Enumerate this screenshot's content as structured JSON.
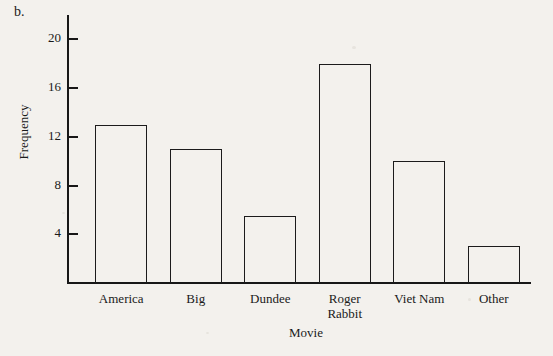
{
  "figure": {
    "part_label": "b.",
    "background_color": "#f3f1ed",
    "ink_color": "#1a1a1a"
  },
  "chart_data": {
    "type": "bar",
    "title": "",
    "categories": [
      "America",
      "Big",
      "Dundee",
      "Roger\nRabbit",
      "Viet Nam",
      "Other"
    ],
    "values": [
      13,
      11,
      5.5,
      18,
      10,
      3
    ],
    "xlabel": "Movie",
    "ylabel": "Frequency",
    "ylim": [
      0,
      22
    ],
    "yticks": [
      4,
      8,
      12,
      16,
      20
    ],
    "ytick_labels": [
      "4",
      "8",
      "12",
      "16",
      "20"
    ],
    "grid": false,
    "legend": false,
    "bar_fill": "none",
    "bar_edge_color": "#1b1b1b"
  }
}
